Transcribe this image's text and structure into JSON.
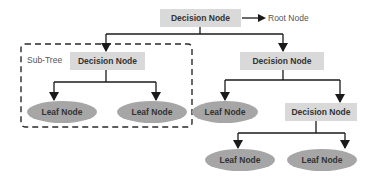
{
  "diagram": {
    "type": "decision-tree",
    "colors": {
      "decision_fill": "#d9d9d9",
      "leaf_fill": "#a6a6a6",
      "line": "#1a1a1a",
      "dashed_border": "#2a2a2a",
      "text": "#333333",
      "label_text": "#555555",
      "background": "#ffffff"
    },
    "annotations": {
      "root_label": "Root Node",
      "subtree_label": "Sub-Tree"
    },
    "nodes": {
      "root": {
        "label": "Decision Node",
        "kind": "decision"
      },
      "left_decision": {
        "label": "Decision Node",
        "kind": "decision"
      },
      "left_leaf_1": {
        "label": "Leaf Node",
        "kind": "leaf"
      },
      "left_leaf_2": {
        "label": "Leaf Node",
        "kind": "leaf"
      },
      "right_decision": {
        "label": "Decision Node",
        "kind": "decision"
      },
      "right_leaf": {
        "label": "Leaf Node",
        "kind": "leaf"
      },
      "right_sub_decision": {
        "label": "Decision Node",
        "kind": "decision"
      },
      "bottom_leaf_1": {
        "label": "Leaf Node",
        "kind": "leaf"
      },
      "bottom_leaf_2": {
        "label": "Leaf Node",
        "kind": "leaf"
      }
    },
    "edges": [
      [
        "root",
        "left_decision"
      ],
      [
        "root",
        "right_decision"
      ],
      [
        "left_decision",
        "left_leaf_1"
      ],
      [
        "left_decision",
        "left_leaf_2"
      ],
      [
        "right_decision",
        "right_leaf"
      ],
      [
        "right_decision",
        "right_sub_decision"
      ],
      [
        "right_sub_decision",
        "bottom_leaf_1"
      ],
      [
        "right_sub_decision",
        "bottom_leaf_2"
      ]
    ]
  }
}
